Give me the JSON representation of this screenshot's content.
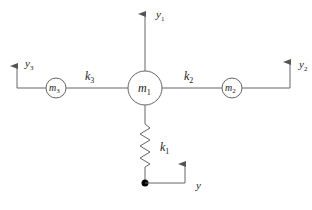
{
  "diagram": {
    "type": "mass-spring system",
    "masses": [
      {
        "id": "m1",
        "label": "m",
        "sub": "1"
      },
      {
        "id": "m2",
        "label": "m",
        "sub": "2"
      },
      {
        "id": "m3",
        "label": "m",
        "sub": "3"
      }
    ],
    "springs": [
      {
        "id": "k1",
        "label": "k",
        "sub": "1"
      },
      {
        "id": "k2",
        "label": "k",
        "sub": "2"
      },
      {
        "id": "k3",
        "label": "k",
        "sub": "3"
      }
    ],
    "displacements": [
      {
        "id": "y1",
        "label": "y",
        "sub": "1"
      },
      {
        "id": "y2",
        "label": "y",
        "sub": "2"
      },
      {
        "id": "y3",
        "label": "y",
        "sub": "3"
      },
      {
        "id": "y",
        "label": "y",
        "sub": ""
      }
    ],
    "colors": {
      "line": "#555555",
      "ground_dot": "#000000"
    }
  }
}
